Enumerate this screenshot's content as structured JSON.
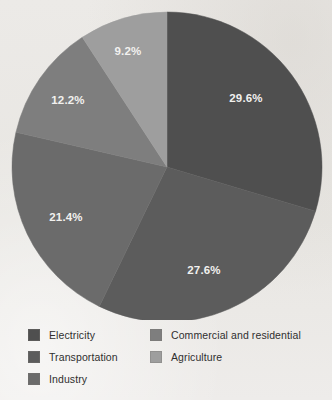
{
  "chart_data": {
    "type": "pie",
    "title": "",
    "categories": [
      "Electricity",
      "Transportation",
      "Industry",
      "Commercial and residential",
      "Agriculture"
    ],
    "values": [
      29.6,
      27.6,
      21.4,
      12.2,
      9.2
    ],
    "value_labels": [
      "29.6%",
      "27.6%",
      "21.4%",
      "12.2%",
      "9.2%"
    ],
    "colors": [
      "#4f4f4f",
      "#5c5c5c",
      "#6b6b6b",
      "#7e7e7e",
      "#9e9e9e"
    ],
    "units": "percent",
    "start_angle_deg": 0,
    "direction": "clockwise",
    "legend_position": "bottom",
    "grid": false,
    "label_color": "#f2f1ef"
  },
  "pie": {
    "center_x": 167,
    "center_y": 167,
    "radius": 155,
    "label_radius_factor": 0.66,
    "slices": [
      {
        "name": "Electricity",
        "value": 29.6,
        "label": "29.6%",
        "color": "#4f4f4f",
        "label_x": 246,
        "label_y": 99
      },
      {
        "name": "Transportation",
        "value": 27.6,
        "label": "27.6%",
        "color": "#5c5c5c",
        "label_x": 204,
        "label_y": 271
      },
      {
        "name": "Industry",
        "value": 21.4,
        "label": "21.4%",
        "color": "#6b6b6b",
        "label_x": 66,
        "label_y": 218
      },
      {
        "name": "Commercial and residential",
        "value": 12.2,
        "label": "12.2%",
        "color": "#7e7e7e",
        "label_x": 68,
        "label_y": 101
      },
      {
        "name": "Agriculture",
        "value": 9.2,
        "label": "9.2%",
        "color": "#9e9e9e",
        "label_x": 128,
        "label_y": 52
      }
    ]
  },
  "legend": {
    "left_column": [
      {
        "label": "Electricity",
        "color": "#4f4f4f"
      },
      {
        "label": "Transportation",
        "color": "#5c5c5c"
      },
      {
        "label": "Industry",
        "color": "#6b6b6b"
      }
    ],
    "right_column": [
      {
        "label": "Commercial and residential",
        "color": "#7e7e7e"
      },
      {
        "label": "Agriculture",
        "color": "#9e9e9e"
      }
    ]
  }
}
